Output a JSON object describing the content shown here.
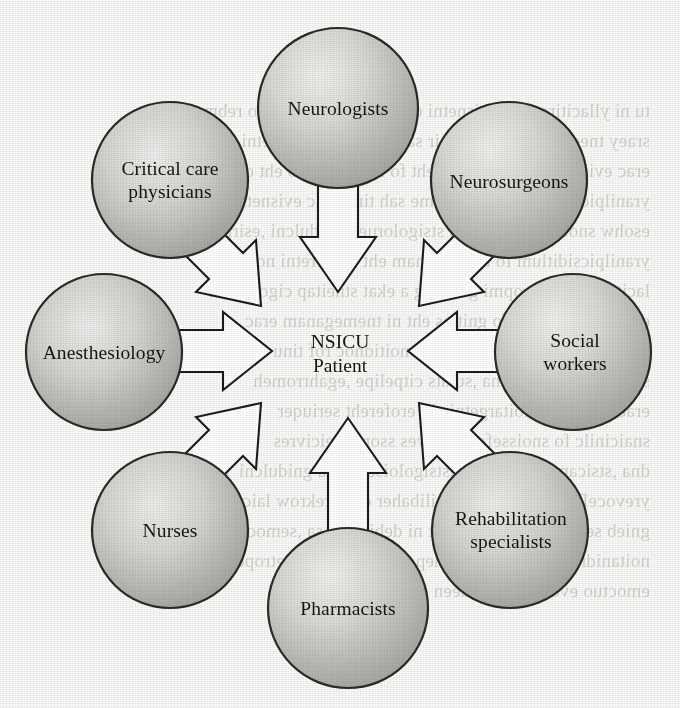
{
  "figure": {
    "type": "hub-and-spoke-diagram",
    "center": {
      "id": "nsicu-patient",
      "label": "NSICU\nPatient",
      "label_lines": [
        "NSICU",
        "Patient"
      ],
      "cx": 340,
      "cy": 354
    },
    "node_shape": "circle",
    "node_fill_light": "#ededea",
    "node_fill_dark": "#a9a7a3",
    "node_stroke": "#2b2a28",
    "arrow_fill": "#ffffff",
    "arrow_stroke": "#1d1c1a",
    "page_background": "#fbfaf8",
    "text_color": "#17150f",
    "nodes": [
      {
        "id": "neurologists",
        "label": "Neurologists",
        "label_lines": [
          "Neurologists"
        ],
        "cx": 338,
        "cy": 108,
        "r": 80,
        "position": "top",
        "arrow_direction": "down"
      },
      {
        "id": "critical-care-physicians",
        "label": "Critical care\nphysicians",
        "label_lines": [
          "Critical care",
          "physicians"
        ],
        "cx": 170,
        "cy": 180,
        "r": 78,
        "position": "top-left",
        "arrow_direction": "down-right"
      },
      {
        "id": "neurosurgeons",
        "label": "Neurosurgeons",
        "label_lines": [
          "Neurosurgeons"
        ],
        "cx": 509,
        "cy": 180,
        "r": 78,
        "position": "top-right",
        "arrow_direction": "down-left"
      },
      {
        "id": "anesthesiology",
        "label": "Anesthesiology",
        "label_lines": [
          "Anesthesiology"
        ],
        "cx": 104,
        "cy": 352,
        "r": 78,
        "position": "left",
        "arrow_direction": "right"
      },
      {
        "id": "social-workers",
        "label": "Social workers",
        "label_lines": [
          "Social workers"
        ],
        "cx": 573,
        "cy": 352,
        "r": 78,
        "position": "right",
        "arrow_direction": "left"
      },
      {
        "id": "nurses",
        "label": "Nurses",
        "label_lines": [
          "Nurses"
        ],
        "cx": 170,
        "cy": 530,
        "r": 78,
        "position": "bottom-left",
        "arrow_direction": "up-right"
      },
      {
        "id": "pharmacists",
        "label": "Pharmacists",
        "label_lines": [
          "Pharmacists"
        ],
        "cx": 348,
        "cy": 608,
        "r": 80,
        "position": "bottom",
        "arrow_direction": "up"
      },
      {
        "id": "rehabilitation-specialists",
        "label": "Rehabilitation\nspecialists",
        "label_lines": [
          "Rehabilitation",
          "specialists"
        ],
        "cx": 510,
        "cy": 530,
        "r": 78,
        "position": "bottom-right",
        "arrow_direction": "up-left"
      }
    ],
    "arrows": [
      {
        "id": "arrow-neurologists",
        "from": "neurologists",
        "to": "nsicu-patient"
      },
      {
        "id": "arrow-critical-care-physicians",
        "from": "critical-care-physicians",
        "to": "nsicu-patient"
      },
      {
        "id": "arrow-neurosurgeons",
        "from": "neurosurgeons",
        "to": "nsicu-patient"
      },
      {
        "id": "arrow-anesthesiology",
        "from": "anesthesiology",
        "to": "nsicu-patient"
      },
      {
        "id": "arrow-social-workers",
        "from": "social-workers",
        "to": "nsicu-patient"
      },
      {
        "id": "arrow-nurses",
        "from": "nurses",
        "to": "nsicu-patient"
      },
      {
        "id": "arrow-pharmacists",
        "from": "pharmacists",
        "to": "nsicu-patient"
      },
      {
        "id": "arrow-rehabilitation-specialists",
        "from": "rehabilitation-specialists",
        "to": "nsicu-patient"
      }
    ]
  },
  "background_bleed": {
    "note": "faint mirrored show-through text from the reverse of the scanned page; illegible",
    "text": "tu ni yllacitirc erac evisnetni ot dettimda stneitap fo rebmun ehT\nsraey tnecer ni ylidaets nesir sah stinu erac evisnetni lacigoloruen\nerac evisnetni lacigoloruen eht fo noitazinagro eht dna\nyranilpicsiditlum a sa degreme sah tinu erac evisnetni\nesohw snoegrusoruen dna stsigoloruen gnidulcni ,esirpretne\nyranilpicsiditlum fo tnemeganam eht ni tseretni nommoc\nlacitirc ni ecnatropmi gniworg a ekat stneitap cigoloruen\nerac evisnetni eht fo gnittes eht ni tnemeganam erac\nroiretna ,amuart daeh sa hcus snoitidnoc rof tinu\nsisirc cinehtsaym dna ,sutats citpelipe ,egahrromeh\nerac tneitap fo noitargetni eht erofereht seriuqer\nsnaicinilc fo snoisseforp lareves ssorca seicivres\ndna ,stsicamrahp ,sesrun ,stsigoloisehtsena gnidulcni\nyrevoceR .stsilaiceps noitatilibaher dna srekrow laicos\ngnieb sedulcni ,erutaretil eht ni debircsed sa ,semoctuo dna\nnoitanidrooc esolc no tnedneped ylhgih eb ot detroper\nemoctuo evorpmi ot dedeen si maet eht fo"
  }
}
